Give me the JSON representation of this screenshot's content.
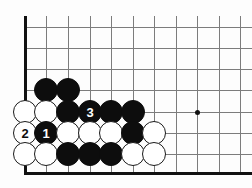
{
  "figure": {
    "kind": "go-board-diagram",
    "title": "",
    "board_corner": "bottom-left",
    "colors": {
      "black_stone": "#0d0d0d",
      "white_stone": "#ffffff",
      "grid_line": "#7c7c7c",
      "board_edge": "#111111",
      "background": "#fdfdfd"
    },
    "geometry": {
      "origin_x": 25,
      "origin_y": 27,
      "spacing": 21.5,
      "stone_diameter": 24,
      "columns": 11,
      "rows": 8
    }
  },
  "grid": {
    "vertical_lines_x": [
      25,
      46,
      68,
      90,
      111,
      133,
      154,
      176,
      197,
      219,
      240
    ],
    "horizontal_lines_y": [
      27,
      48,
      69,
      90,
      112,
      133,
      154,
      173
    ],
    "left_edge_thick": true,
    "bottom_edge_thick": true
  },
  "star_points": [
    {
      "name": "hoshi",
      "x": 197,
      "y": 112
    }
  ],
  "stones": [
    {
      "name": "black-stone",
      "color": "black",
      "col": 1,
      "row": 3,
      "x": 46,
      "y": 90,
      "label": ""
    },
    {
      "name": "black-stone",
      "color": "black",
      "col": 2,
      "row": 3,
      "x": 68,
      "y": 90,
      "label": ""
    },
    {
      "name": "white-stone",
      "color": "white",
      "col": 0,
      "row": 4,
      "x": 25,
      "y": 112,
      "label": ""
    },
    {
      "name": "white-stone",
      "color": "white",
      "col": 1,
      "row": 4,
      "x": 46,
      "y": 112,
      "label": ""
    },
    {
      "name": "black-stone",
      "color": "black",
      "col": 2,
      "row": 4,
      "x": 68,
      "y": 112,
      "label": ""
    },
    {
      "name": "black-move-3",
      "color": "black",
      "col": 3,
      "row": 4,
      "x": 90,
      "y": 112,
      "label": "3"
    },
    {
      "name": "black-stone",
      "color": "black",
      "col": 4,
      "row": 4,
      "x": 111,
      "y": 112,
      "label": ""
    },
    {
      "name": "black-stone",
      "color": "black",
      "col": 5,
      "row": 4,
      "x": 133,
      "y": 112,
      "label": ""
    },
    {
      "name": "white-move-2",
      "color": "white",
      "col": 0,
      "row": 5,
      "x": 25,
      "y": 133,
      "label": "2"
    },
    {
      "name": "black-move-1",
      "color": "black",
      "col": 1,
      "row": 5,
      "x": 46,
      "y": 133,
      "label": "1"
    },
    {
      "name": "white-stone",
      "color": "white",
      "col": 2,
      "row": 5,
      "x": 68,
      "y": 133,
      "label": ""
    },
    {
      "name": "white-stone",
      "color": "white",
      "col": 3,
      "row": 5,
      "x": 90,
      "y": 133,
      "label": ""
    },
    {
      "name": "white-stone",
      "color": "white",
      "col": 4,
      "row": 5,
      "x": 111,
      "y": 133,
      "label": ""
    },
    {
      "name": "black-stone",
      "color": "black",
      "col": 5,
      "row": 5,
      "x": 133,
      "y": 133,
      "label": ""
    },
    {
      "name": "white-stone",
      "color": "white",
      "col": 6,
      "row": 5,
      "x": 154,
      "y": 133,
      "label": ""
    },
    {
      "name": "white-stone",
      "color": "white",
      "col": 0,
      "row": 6,
      "x": 25,
      "y": 154,
      "label": ""
    },
    {
      "name": "white-stone",
      "color": "white",
      "col": 1,
      "row": 6,
      "x": 46,
      "y": 154,
      "label": ""
    },
    {
      "name": "black-stone",
      "color": "black",
      "col": 2,
      "row": 6,
      "x": 68,
      "y": 154,
      "label": ""
    },
    {
      "name": "black-stone",
      "color": "black",
      "col": 3,
      "row": 6,
      "x": 90,
      "y": 154,
      "label": ""
    },
    {
      "name": "black-stone",
      "color": "black",
      "col": 4,
      "row": 6,
      "x": 111,
      "y": 154,
      "label": ""
    },
    {
      "name": "white-stone",
      "color": "white",
      "col": 5,
      "row": 6,
      "x": 133,
      "y": 154,
      "label": ""
    },
    {
      "name": "white-stone",
      "color": "white",
      "col": 6,
      "row": 6,
      "x": 154,
      "y": 154,
      "label": ""
    }
  ],
  "move_sequence": [
    {
      "number": "1",
      "color": "black"
    },
    {
      "number": "2",
      "color": "white"
    },
    {
      "number": "3",
      "color": "black"
    }
  ]
}
